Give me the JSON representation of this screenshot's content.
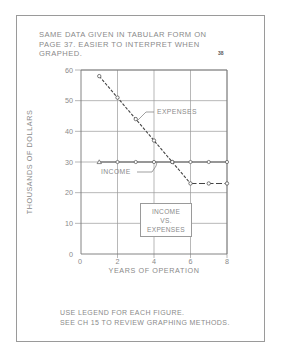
{
  "page": {
    "top_note_lines": [
      "SAME DATA GIVEN IN TABULAR FORM ON",
      "PAGE 37. EASIER TO INTERPRET WHEN",
      "GRAPHED."
    ],
    "page_number": "38",
    "bottom_note_lines": [
      "USE LEGEND FOR EACH FIGURE.",
      "SEE CH 15 TO REVIEW GRAPHING METHODS."
    ]
  },
  "chart_data": {
    "type": "line",
    "title": "INCOME VS. EXPENSES",
    "title_lines": [
      "INCOME",
      "VS.",
      "EXPENSES"
    ],
    "xlabel": "YEARS OF OPERATION",
    "ylabel": "THOUSANDS OF DOLLARS",
    "xlim": [
      0,
      8
    ],
    "ylim": [
      0,
      60
    ],
    "x_ticks": [
      "0",
      "2",
      "4",
      "6",
      "8"
    ],
    "y_ticks": [
      "0",
      "10",
      "20",
      "30",
      "40",
      "50",
      "60"
    ],
    "grid": true,
    "legend_position": "inside, lower center (boxed title)",
    "x": [
      1,
      2,
      3,
      4,
      5,
      6,
      7,
      8
    ],
    "series": [
      {
        "name": "EXPENSES",
        "values": [
          58,
          51,
          44,
          37,
          30,
          23,
          23,
          23
        ],
        "style": "dashed",
        "marker": "circle"
      },
      {
        "name": "INCOME",
        "values": [
          30,
          30,
          30,
          30,
          30,
          30,
          30,
          30
        ],
        "style": "solid",
        "marker": "circle (triangle at x=1)"
      }
    ],
    "annotations": [
      {
        "text": "EXPENSES",
        "points_to": "expenses line near x=4.3"
      },
      {
        "text": "INCOME",
        "points_to": "income line near x=4"
      }
    ]
  },
  "colors": {
    "ink": "#8a8a8a",
    "line": "#444444",
    "grid": "#9a9a9a"
  }
}
